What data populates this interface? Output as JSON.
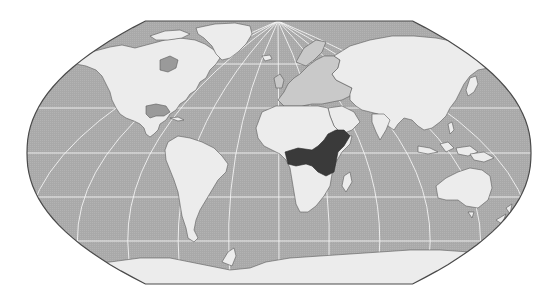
{
  "figure": {
    "type": "world-map",
    "projection": "Robinson-like pseudocylindrical",
    "highlighted_region_label": "Central / East Africa",
    "highlighted_countries": [
      "Democratic Republic of the Congo",
      "Uganda",
      "Kenya",
      "Tanzania",
      "Rwanda",
      "Burundi",
      "Somalia"
    ]
  },
  "colors": {
    "background": "#ffffff",
    "ocean": "#a9a9a9",
    "land": "#ececec",
    "land_europe": "#c9c9c9",
    "inland_water": "#9a9a9a",
    "highlight": "#3a3a3a",
    "coastline": "#5a5a5a",
    "graticule": "#f4f4f4",
    "frame": "#4a4a4a"
  },
  "graticule": {
    "parallels_y": [
      64,
      108,
      153,
      197,
      241
    ],
    "meridian_convergence": {
      "x": 278,
      "y": 21
    }
  },
  "frame": {
    "left": 27,
    "right": 531,
    "top": 21,
    "bottom": 284,
    "center_x": 279,
    "equator_y": 153
  }
}
